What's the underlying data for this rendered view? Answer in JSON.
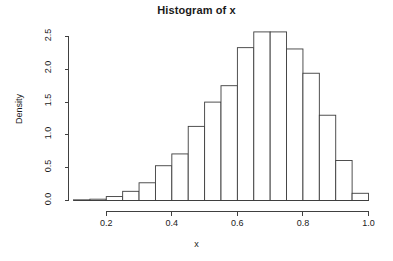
{
  "plot": {
    "title": "Histogram of x",
    "xlabel": "x",
    "ylabel": "Density"
  },
  "axes": {
    "x_ticks": [
      "0.2",
      "0.4",
      "0.6",
      "0.8",
      "1.0"
    ],
    "y_ticks": [
      "0.0",
      "0.5",
      "1.0",
      "1.5",
      "2.0",
      "2.5"
    ]
  },
  "chart_data": {
    "type": "bar",
    "title": "Histogram of x",
    "xlabel": "x",
    "ylabel": "Density",
    "xlim": [
      0.1,
      1.0
    ],
    "ylim": [
      0.0,
      2.5
    ],
    "grid": false,
    "legend": null,
    "bin_width": 0.05,
    "bin_edges": [
      0.1,
      0.15,
      0.2,
      0.25,
      0.3,
      0.35,
      0.4,
      0.45,
      0.5,
      0.55,
      0.6,
      0.65,
      0.7,
      0.75,
      0.8,
      0.85,
      0.9,
      0.95,
      1.0
    ],
    "categories": [
      "0.10-0.15",
      "0.15-0.20",
      "0.20-0.25",
      "0.25-0.30",
      "0.30-0.35",
      "0.35-0.40",
      "0.40-0.45",
      "0.45-0.50",
      "0.50-0.55",
      "0.55-0.60",
      "0.60-0.65",
      "0.65-0.70",
      "0.70-0.75",
      "0.75-0.80",
      "0.80-0.85",
      "0.85-0.90",
      "0.90-0.95",
      "0.95-1.00"
    ],
    "values": [
      0.01,
      0.02,
      0.06,
      0.14,
      0.27,
      0.53,
      0.71,
      1.13,
      1.5,
      1.75,
      2.33,
      2.57,
      2.57,
      2.31,
      1.94,
      1.3,
      0.61,
      0.11
    ],
    "x_tick_values": [
      0.2,
      0.4,
      0.6,
      0.8,
      1.0
    ],
    "y_tick_values": [
      0.0,
      0.5,
      1.0,
      1.5,
      2.0,
      2.5
    ],
    "bar_fill": "#ffffff",
    "bar_stroke": "#3d3d3d"
  }
}
